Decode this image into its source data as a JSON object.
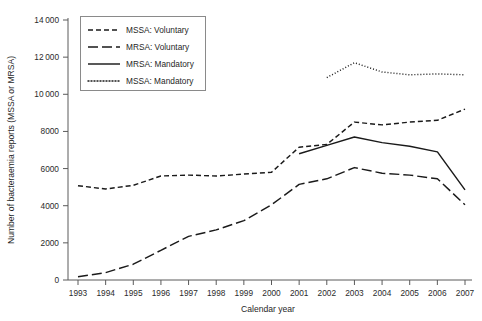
{
  "chart_data": {
    "type": "line",
    "title": "",
    "xlabel": "Calendar year",
    "ylabel": "Number of bacteraemia reports (MSSA or MRSA)",
    "x": [
      1993,
      1994,
      1995,
      1996,
      1997,
      1998,
      1999,
      2000,
      2001,
      2002,
      2003,
      2004,
      2005,
      2006,
      2007
    ],
    "xlim": [
      1993,
      2007
    ],
    "ylim": [
      0,
      14000
    ],
    "xticks": [
      "1993",
      "1994",
      "1995",
      "1996",
      "1997",
      "1998",
      "1999",
      "2000",
      "2001",
      "2002",
      "2003",
      "2004",
      "2005",
      "2006",
      "2007"
    ],
    "yticks": [
      "0",
      "2000",
      "4000",
      "6000",
      "8000",
      "10000",
      "12000",
      "14000"
    ],
    "ytick_values": [
      0,
      2000,
      4000,
      6000,
      8000,
      10000,
      12000,
      14000
    ],
    "grid": false,
    "legend_position": "upper-left",
    "series": [
      {
        "name": "MSSA: Voluntary",
        "dash": "5,3",
        "x": [
          1993,
          1994,
          1995,
          1996,
          1997,
          1998,
          1999,
          2000,
          2001,
          2002,
          2003,
          2004,
          2005,
          2006,
          2007
        ],
        "values": [
          5080,
          4900,
          5100,
          5600,
          5650,
          5600,
          5700,
          5800,
          7150,
          7300,
          8500,
          8350,
          8500,
          8600,
          9200
        ]
      },
      {
        "name": "MRSA: Voluntary",
        "dash": "10,4",
        "x": [
          1993,
          1994,
          1995,
          1996,
          1997,
          1998,
          1999,
          2000,
          2001,
          2002,
          2003,
          2004,
          2005,
          2006,
          2007
        ],
        "values": [
          170,
          400,
          850,
          1600,
          2350,
          2700,
          3200,
          4050,
          5150,
          5450,
          6050,
          5750,
          5650,
          5450,
          4050
        ]
      },
      {
        "name": "MRSA: Mandatory",
        "dash": "none",
        "x": [
          2001,
          2002,
          2003,
          2004,
          2005,
          2006,
          2007
        ],
        "values": [
          6800,
          7250,
          7700,
          7400,
          7200,
          6900,
          4850
        ]
      },
      {
        "name": "MSSA: Mandatory",
        "dash": "1,2",
        "x": [
          2002,
          2003,
          2004,
          2005,
          2006,
          2007
        ],
        "values": [
          10900,
          11700,
          11200,
          11050,
          11100,
          11050
        ]
      }
    ]
  },
  "legend": {
    "entries": [
      {
        "label": "MSSA: Voluntary"
      },
      {
        "label": "MRSA: Voluntary"
      },
      {
        "label": "MRSA: Mandatory"
      },
      {
        "label": "MSSA: Mandatory"
      }
    ]
  }
}
